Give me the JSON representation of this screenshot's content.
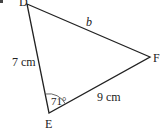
{
  "diagram": {
    "type": "triangle",
    "vertices": {
      "D": {
        "label": "D",
        "x": 27,
        "y": 4
      },
      "E": {
        "label": "E",
        "x": 49,
        "y": 113
      },
      "F": {
        "label": "F",
        "x": 150,
        "y": 57
      }
    },
    "sides": {
      "DE": {
        "label": "7 cm"
      },
      "EF": {
        "label": "9 cm"
      },
      "DF": {
        "label": "b"
      }
    },
    "angles": {
      "E": {
        "label": "71°"
      }
    },
    "colors": {
      "stroke": "#222222",
      "background": "#ffffff"
    }
  }
}
